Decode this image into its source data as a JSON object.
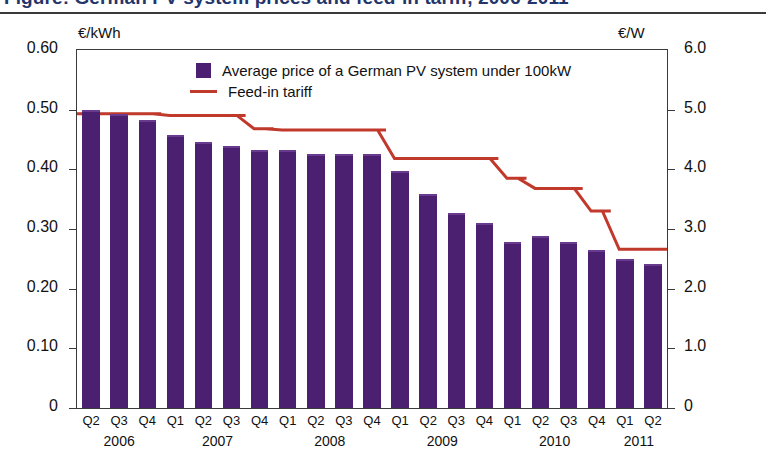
{
  "title": "Figure: German PV system prices and feed-in tariff, 2006-2011",
  "axes": {
    "left_unit": "€/kWh",
    "right_unit": "€/W",
    "left_ticks": [
      "0.60",
      "0.50",
      "0.40",
      "0.30",
      "0.20",
      "0.10",
      "0"
    ],
    "right_ticks": [
      "6.0",
      "5.0",
      "4.0",
      "3.0",
      "2.0",
      "1.0",
      "0"
    ]
  },
  "legend": {
    "items": [
      {
        "label": "Average price of a German PV system under 100kW",
        "color": "#4b2070",
        "marker": "square"
      },
      {
        "label": "Feed-in tariff",
        "color": "#c0392b",
        "marker": "line"
      }
    ]
  },
  "year_groups": [
    {
      "year": "2006",
      "count": 3
    },
    {
      "year": "2007",
      "count": 4
    },
    {
      "year": "2008",
      "count": 4
    },
    {
      "year": "2009",
      "count": 4
    },
    {
      "year": "2010",
      "count": 4
    },
    {
      "year": "2011",
      "count": 2
    }
  ],
  "chart_data": {
    "type": "bar",
    "xlabel": "",
    "ylabel": "€/kWh",
    "y2label": "€/W",
    "ylim": [
      0,
      0.6
    ],
    "y2lim": [
      0,
      6.0
    ],
    "grid": false,
    "legend_position": "top-center",
    "categories": [
      "Q2 2006",
      "Q3 2006",
      "Q4 2006",
      "Q1 2007",
      "Q2 2007",
      "Q3 2007",
      "Q4 2007",
      "Q1 2008",
      "Q2 2008",
      "Q3 2008",
      "Q4 2008",
      "Q1 2009",
      "Q2 2009",
      "Q3 2009",
      "Q4 2009",
      "Q1 2010",
      "Q2 2010",
      "Q3 2010",
      "Q4 2010",
      "Q1 2011",
      "Q2 2011"
    ],
    "quarter_labels": [
      "Q2",
      "Q3",
      "Q4",
      "Q1",
      "Q2",
      "Q3",
      "Q4",
      "Q1",
      "Q2",
      "Q3",
      "Q4",
      "Q1",
      "Q2",
      "Q3",
      "Q4",
      "Q1",
      "Q2",
      "Q3",
      "Q4",
      "Q1",
      "Q2"
    ],
    "series": [
      {
        "name": "Average price of a German PV system under 100kW",
        "type": "bar",
        "axis": "right",
        "unit": "€/W",
        "color": "#4b2070",
        "values": [
          5.0,
          4.92,
          4.83,
          4.57,
          4.45,
          4.39,
          4.32,
          4.32,
          4.26,
          4.26,
          4.25,
          3.98,
          3.59,
          3.27,
          3.1,
          2.79,
          2.88,
          2.79,
          2.65,
          2.5,
          2.41
        ]
      },
      {
        "name": "Feed-in tariff",
        "type": "line",
        "axis": "right",
        "unit": "€/W",
        "color": "#c0392b",
        "values": [
          4.93,
          4.93,
          4.93,
          4.9,
          4.9,
          4.9,
          4.68,
          4.66,
          4.66,
          4.66,
          4.66,
          4.18,
          4.18,
          4.18,
          4.18,
          3.85,
          3.68,
          3.68,
          3.3,
          2.66,
          2.66
        ]
      }
    ]
  }
}
